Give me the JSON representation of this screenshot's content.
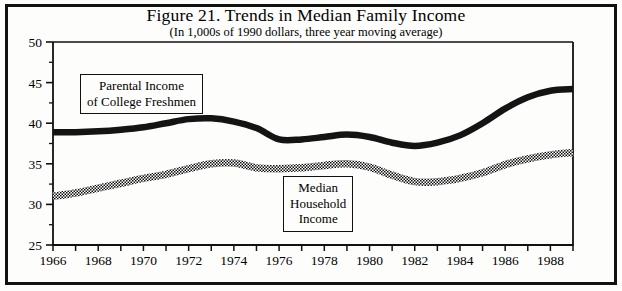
{
  "figure": {
    "title": "Figure 21. Trends in Median Family Income",
    "subtitle": "(In 1,000s of 1990 dollars, three year moving average)"
  },
  "annotations": {
    "parental": {
      "line1": "Parental Income",
      "line2": "of College Freshmen"
    },
    "median": {
      "line1": "Median",
      "line2": "Household",
      "line3": "Income"
    }
  },
  "colors": {
    "ink": "#111111",
    "paper": "#fdfdfb",
    "series_solid": "#141414",
    "series_hatched": "#6f6f6f"
  },
  "chart_data": {
    "type": "line",
    "title": "Figure 21. Trends in Median Family Income",
    "subtitle": "(In 1,000s of 1990 dollars, three year moving average)",
    "xlabel": "",
    "ylabel": "",
    "ylim": [
      25,
      50
    ],
    "xlim": [
      1966,
      1989
    ],
    "ytick_step": 5,
    "yticks": [
      25,
      30,
      35,
      40,
      45,
      50
    ],
    "ytick_labels": [
      "25",
      "30",
      "35",
      "40",
      "45",
      "50"
    ],
    "yminor_step": 2.5,
    "xtick_step": 1,
    "xtick_labels_step": 2,
    "xticks": [
      1966,
      1967,
      1968,
      1969,
      1970,
      1971,
      1972,
      1973,
      1974,
      1975,
      1976,
      1977,
      1978,
      1979,
      1980,
      1981,
      1982,
      1983,
      1984,
      1985,
      1986,
      1987,
      1988,
      1989
    ],
    "xtick_labels": [
      "1966",
      "",
      "1968",
      "",
      "1970",
      "",
      "1972",
      "",
      "1974",
      "",
      "1976",
      "",
      "1978",
      "",
      "1980",
      "",
      "1982",
      "",
      "1984",
      "",
      "1986",
      "",
      "1988",
      ""
    ],
    "grid": false,
    "legend": "inline-labels",
    "x": [
      1966,
      1967,
      1968,
      1969,
      1970,
      1971,
      1972,
      1973,
      1974,
      1975,
      1976,
      1977,
      1978,
      1979,
      1980,
      1981,
      1982,
      1983,
      1984,
      1985,
      1986,
      1987,
      1988,
      1989
    ],
    "series": [
      {
        "name": "Parental Income of College Freshmen",
        "style": "solid-thick-black",
        "values": [
          38.9,
          38.9,
          39.0,
          39.2,
          39.5,
          40.0,
          40.5,
          40.6,
          40.2,
          39.4,
          38.0,
          38.0,
          38.3,
          38.6,
          38.3,
          37.6,
          37.2,
          37.6,
          38.5,
          40.0,
          41.8,
          43.2,
          44.0,
          44.2
        ]
      },
      {
        "name": "Median Household Income",
        "style": "hatched-thick-gray",
        "values": [
          31.0,
          31.4,
          32.0,
          32.6,
          33.2,
          33.7,
          34.4,
          35.0,
          35.1,
          34.5,
          34.4,
          34.5,
          34.8,
          35.0,
          34.6,
          33.6,
          32.8,
          32.8,
          33.2,
          33.9,
          34.9,
          35.6,
          36.1,
          36.4
        ]
      }
    ]
  }
}
